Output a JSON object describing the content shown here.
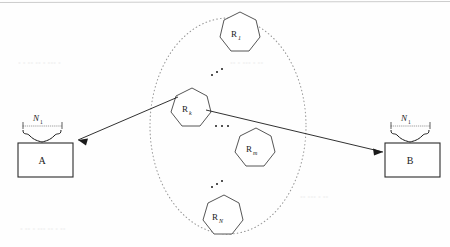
{
  "figure": {
    "canvas": {
      "width": 450,
      "height": 247,
      "background": "#fefefe"
    },
    "colors": {
      "stroke": "#2b2b2b",
      "ellipse_dotted": "#9a9a9a",
      "arrow": "#1a1a1a",
      "text": "#1a1a1a",
      "fill": "#ffffff"
    },
    "source_box": {
      "label": "A",
      "brace_label": "N",
      "brace_sub": "1"
    },
    "dest_box": {
      "label": "B",
      "brace_label": "N",
      "brace_sub": "1"
    },
    "relay_cluster": {
      "shape": "dotted-ellipse",
      "nodes": [
        {
          "id": "r1",
          "label": "R",
          "sub": "1"
        },
        {
          "id": "rk",
          "label": "R",
          "sub": "k"
        },
        {
          "id": "rm",
          "label": "R",
          "sub": "m"
        },
        {
          "id": "rN",
          "label": "R",
          "sub": "N"
        }
      ],
      "ellipsis": "⋰"
    },
    "arrows": [
      {
        "id": "arrow-to-a",
        "from": "rk",
        "to": "A",
        "direction": "left"
      },
      {
        "id": "arrow-to-b",
        "from": "rk",
        "to": "B",
        "direction": "right"
      }
    ]
  }
}
